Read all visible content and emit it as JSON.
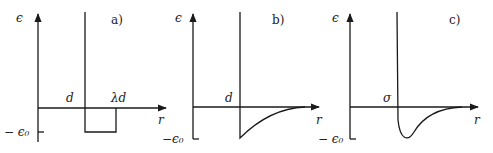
{
  "panels": [
    {
      "id": "a",
      "tag": "a)",
      "y_label": "ϵ",
      "x_label": "r",
      "min_label": "− ϵ₀",
      "marks": [
        "d",
        "λd"
      ],
      "shape": "square-well"
    },
    {
      "id": "b",
      "tag": "b)",
      "y_label": "ϵ",
      "x_label": "r",
      "min_label": "−ϵ₀",
      "marks": [
        "d"
      ],
      "shape": "hard-core-attractive-tail"
    },
    {
      "id": "c",
      "tag": "c)",
      "y_label": "ϵ",
      "x_label": "r",
      "min_label": "− ϵ₀",
      "marks": [
        "σ"
      ],
      "shape": "lennard-jones"
    }
  ]
}
